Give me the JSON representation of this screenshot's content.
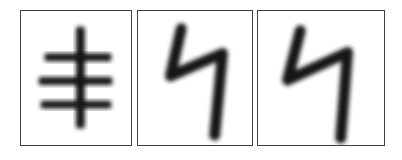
{
  "image": {
    "title": "Handwritten character samples",
    "background_color": "#ffffff",
    "ink_color": "#141414",
    "border_color": "#3f3f3f",
    "width": 402,
    "height": 160,
    "panel_count": 3
  },
  "panels": [
    {
      "id": "panel-1",
      "label": "Character sample 1",
      "character": "丰",
      "description": "Vertical stroke crossed by three horizontal bars",
      "stroke_count": 4,
      "x": 20,
      "y": 10,
      "width": 112,
      "height": 136,
      "strokes": {
        "vertical": {
          "x": 56,
          "y1": 16,
          "y2": 119,
          "width": 9
        },
        "bars": [
          {
            "name": "top-bar",
            "x1": 24,
            "x2": 92,
            "y": 43,
            "height": 8
          },
          {
            "name": "middle-bar",
            "x1": 18,
            "x2": 93,
            "y": 67,
            "height": 8
          },
          {
            "name": "bottom-bar",
            "x1": 20,
            "x2": 92,
            "y": 91,
            "height": 8
          }
        ]
      }
    },
    {
      "id": "panel-2",
      "label": "Character sample 2",
      "character": "4",
      "description": "Handwritten open-top digit four",
      "stroke_count": 1,
      "x": 137,
      "y": 10,
      "width": 116,
      "height": 136,
      "path": "M 44 18 L 33 66 L 86 43 L 78 126",
      "stroke_width": 11
    },
    {
      "id": "panel-3",
      "label": "Character sample 3",
      "character": "4",
      "description": "Handwritten open-top digit four",
      "stroke_count": 1,
      "x": 257,
      "y": 10,
      "width": 128,
      "height": 136,
      "path": "M 43 20 L 30 70 L 91 42 L 84 129",
      "stroke_width": 11
    }
  ]
}
